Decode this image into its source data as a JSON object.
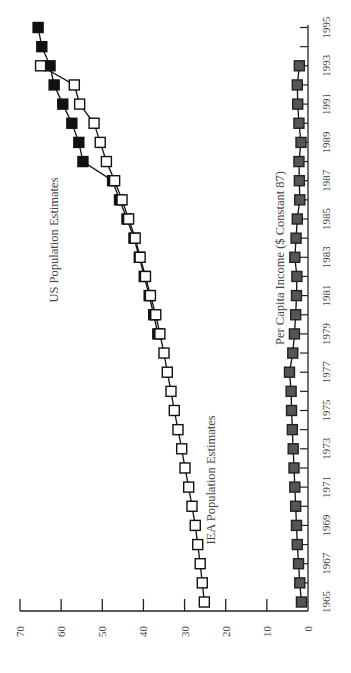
{
  "chart_data": {
    "type": "line",
    "orientation": "rotated-90-ccw",
    "title": "",
    "xlabel": "",
    "ylabel": "",
    "x": [
      1965,
      1966,
      1967,
      1968,
      1969,
      1970,
      1971,
      1972,
      1973,
      1974,
      1975,
      1976,
      1977,
      1978,
      1979,
      1980,
      1981,
      1982,
      1983,
      1984,
      1985,
      1986,
      1987,
      1988,
      1989,
      1990,
      1991,
      1992,
      1993,
      1994,
      1995
    ],
    "x_tick_labels": [
      "1965",
      "1967",
      "1969",
      "1971",
      "1973",
      "1975",
      "1977",
      "1979",
      "1981",
      "1983",
      "1985",
      "1987",
      "1989",
      "1991",
      "1993",
      "1995"
    ],
    "y_tick_labels": [
      "0",
      "10",
      "20",
      "30",
      "40",
      "50",
      "60",
      "70"
    ],
    "ylim": [
      0,
      70
    ],
    "xlim": [
      1965,
      1995
    ],
    "grid": false,
    "series": [
      {
        "name": "IEA Population Estimates",
        "marker": "open-square",
        "color": "#ffffff",
        "x": [
          1965,
          1966,
          1967,
          1968,
          1969,
          1970,
          1971,
          1972,
          1973,
          1974,
          1975,
          1976,
          1977,
          1978,
          1979,
          1980,
          1981,
          1982,
          1983,
          1984,
          1985,
          1986,
          1987,
          1988,
          1989,
          1990,
          1991,
          1992,
          1993
        ],
        "values": [
          25.2,
          25.7,
          26.2,
          26.8,
          27.4,
          28.2,
          29.0,
          29.9,
          30.7,
          31.6,
          32.5,
          33.3,
          34.2,
          35.0,
          36.0,
          37.0,
          38.3,
          39.5,
          40.8,
          42.0,
          43.6,
          45.2,
          47.0,
          49.0,
          50.5,
          52.0,
          55.5,
          56.8,
          65.0
        ]
      },
      {
        "name": "US Population Estimates",
        "marker": "filled-square",
        "color": "#000000",
        "x": [
          1979,
          1980,
          1981,
          1982,
          1983,
          1984,
          1985,
          1986,
          1987,
          1988,
          1989,
          1990,
          1991,
          1992,
          1993,
          1994,
          1995
        ],
        "values": [
          36.5,
          37.5,
          38.6,
          39.8,
          41.0,
          42.3,
          44.0,
          45.8,
          47.5,
          54.7,
          55.7,
          57.4,
          59.6,
          61.7,
          62.7,
          64.7,
          65.6
        ]
      },
      {
        "name": "Per Capita Income ($ Constant 87)",
        "marker": "filled-square",
        "color": "#555555",
        "x": [
          1965,
          1966,
          1967,
          1968,
          1969,
          1970,
          1971,
          1972,
          1973,
          1974,
          1975,
          1976,
          1977,
          1978,
          1979,
          1980,
          1981,
          1982,
          1983,
          1984,
          1985,
          1986,
          1987,
          1988,
          1989,
          1990,
          1991,
          1992,
          1993
        ],
        "values": [
          1.6,
          2.0,
          2.3,
          2.6,
          2.8,
          3.0,
          3.2,
          3.4,
          3.6,
          3.8,
          4.0,
          4.1,
          4.5,
          3.7,
          3.3,
          3.0,
          2.8,
          2.7,
          3.2,
          2.9,
          2.6,
          2.0,
          2.1,
          2.2,
          1.7,
          2.2,
          2.5,
          2.6,
          2.1
        ]
      }
    ],
    "annotations": [
      {
        "text": "US Population Estimates"
      },
      {
        "text": "IEA Population Estimates"
      },
      {
        "text": "Per Capita Income ($ Constant 87)"
      }
    ]
  }
}
